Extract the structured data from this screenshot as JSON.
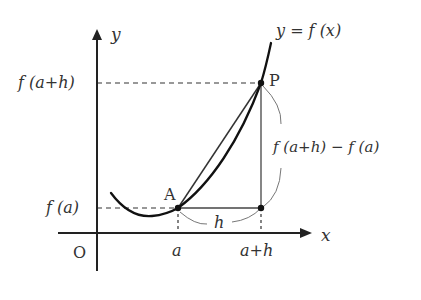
{
  "diagram": {
    "type": "function-graph",
    "colors": {
      "background": "#ffffff",
      "ink": "#222222",
      "text": "#333333",
      "thin_line": "#555555",
      "brace": "#777777"
    },
    "axes": {
      "x_label": "x",
      "y_label": "y",
      "origin_label": "O"
    },
    "curve": {
      "label": "y = f (x)"
    },
    "points": {
      "A": {
        "label": "A"
      },
      "P": {
        "label": "P"
      }
    },
    "ticks": {
      "x": [
        "a",
        "a+h"
      ],
      "y": [
        "f (a)",
        "f (a+h)"
      ]
    },
    "annotations": {
      "horizontal_change": "h",
      "vertical_change": "f (a+h) − f (a)"
    }
  }
}
